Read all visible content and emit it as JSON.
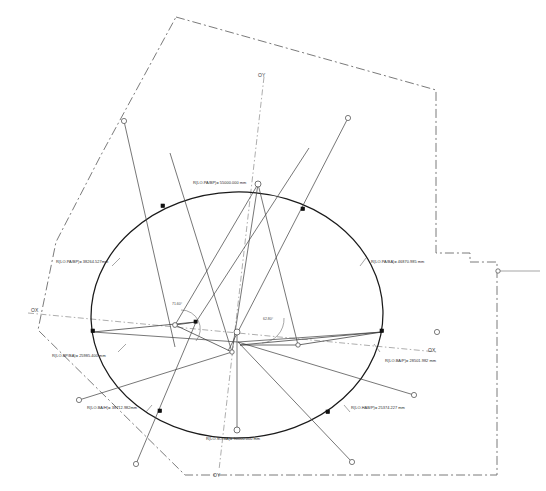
{
  "drawing": {
    "title": "Geodetic radius construction diagram",
    "background_color": "#ffffff",
    "line_color": "#4a4a4a",
    "accent_color": "#111111"
  },
  "axes": {
    "ox_left_label": "OX",
    "ox_right_label": "OX",
    "oy_top_label": "OY",
    "oy_bottom_label": "OY"
  },
  "radius_labels": {
    "top_center": "R(LO.PA/BP)= 55000.000 mm",
    "upper_left": "R(LO.PA/BP)= 38264.527mm",
    "upper_right": "R(LO.PA/BA)= 46870.985 mm",
    "mid_left": "R(LO.BP/BA)= 25985.400 mm",
    "mid_right": "R(LO.BA/P)= 28501.982 mm",
    "lower_left": "R(LO.BA/H)= 38712.982mm",
    "lower_right": "R(LO.HAB/P)= 25374.227 mm",
    "bottom_center": "R(LO.SO.BA)= 90000.000 mm"
  },
  "angles": {
    "left": "71.60°",
    "right": "62.80°"
  },
  "markers": {
    "open_node": "open-circle-node",
    "filled_node": "filled-square-node",
    "ring_node": "ring-node"
  }
}
